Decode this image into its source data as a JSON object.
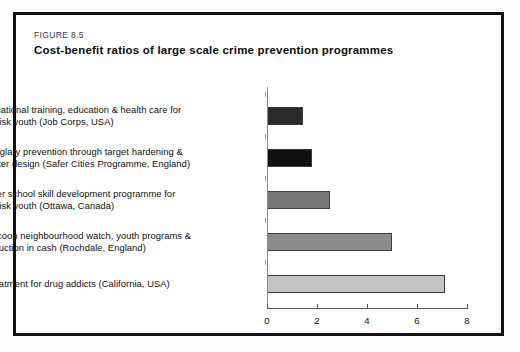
{
  "figure": {
    "number": "FIGURE 8.5",
    "title": "Cost-benefit ratios of large scale crime prevention programmes"
  },
  "chart_data": {
    "type": "bar",
    "orientation": "horizontal",
    "title": "Cost-benefit ratios of large scale crime prevention programmes",
    "xlabel": "",
    "ylabel": "",
    "xlim": [
      0,
      8
    ],
    "xticks": [
      0,
      2,
      4,
      6,
      8
    ],
    "xtick_labels": [
      "0",
      "2",
      "4",
      "6",
      "8"
    ],
    "grid": false,
    "legend": "none",
    "categories": [
      "Vocational training, education & health care for at-risk youth (Job Corps, USA)",
      "Burglary prevention through target hardening & better design (Safer Cities Programme, England)",
      "After school skill development programme for at-risk youth (Ottawa, Canada)",
      "Cocoon neighbourhood watch, youth programs & reduction in cash (Rochdale, England)",
      "Treatment for drug addicts (California, USA)"
    ],
    "values": [
      1.45,
      1.8,
      2.5,
      5.0,
      7.1
    ],
    "bar_colors": [
      "#2b2b2b",
      "#111111",
      "#767676",
      "#8c8c8c",
      "#c4c4c4"
    ]
  },
  "bars": [
    {
      "label_line1": "Vocational training, education & health care for",
      "label_line2": "at-risk youth (Job Corps, USA)",
      "value": 1.45,
      "color": "#2b2b2b"
    },
    {
      "label_line1": "Burglary prevention through target hardening &",
      "label_line2": "better design (Safer Cities Programme, England)",
      "value": 1.8,
      "color": "#111111"
    },
    {
      "label_line1": "After school skill development programme for",
      "label_line2": "at-risk youth (Ottawa, Canada)",
      "value": 2.5,
      "color": "#767676"
    },
    {
      "label_line1": "Cocoon neighbourhood watch, youth programs &",
      "label_line2": "reduction in cash (Rochdale, England)",
      "value": 5.0,
      "color": "#8c8c8c"
    },
    {
      "label_line1": "Treatment for drug addicts (California, USA)",
      "label_line2": "",
      "value": 7.1,
      "color": "#c4c4c4"
    }
  ],
  "axis": {
    "ticks": [
      "0",
      "2",
      "4",
      "6",
      "8"
    ]
  }
}
